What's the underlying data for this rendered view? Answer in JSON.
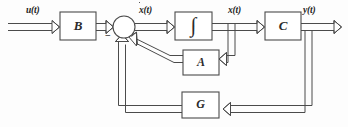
{
  "diagram": {
    "type": "control-system-block-diagram",
    "line_color": "#4b4b4b",
    "text_color": "#1f1f1f",
    "background": "#fdfdfd",
    "blocks": [
      {
        "id": "B",
        "label": "B",
        "name": "input-matrix-block",
        "x": 60,
        "y": 12,
        "w": 36,
        "h": 28
      },
      {
        "id": "INT",
        "label": "∫",
        "name": "integrator-block",
        "x": 175,
        "y": 12,
        "w": 37,
        "h": 28
      },
      {
        "id": "C",
        "label": "C",
        "name": "output-matrix-block",
        "x": 265,
        "y": 12,
        "w": 36,
        "h": 28
      },
      {
        "id": "A",
        "label": "A",
        "name": "state-matrix-block",
        "x": 183,
        "y": 50,
        "w": 36,
        "h": 25
      },
      {
        "id": "G",
        "label": "G",
        "name": "feedback-gain-block",
        "x": 182,
        "y": 92,
        "w": 37,
        "h": 26
      }
    ],
    "summing_junction": {
      "name": "summing-junction",
      "cx": 124,
      "cy": 27,
      "r": 11,
      "sign": "−"
    },
    "signals": [
      {
        "id": "u",
        "label": "u(t)",
        "name": "signal-label-u",
        "x": 26,
        "y": 6
      },
      {
        "id": "xdot",
        "label": "x(t)",
        "base": "x",
        "suffix": "(t)",
        "dotted": true,
        "name": "signal-label-xdot",
        "x": 139,
        "y": 6
      },
      {
        "id": "x",
        "label": "x(t)",
        "name": "signal-label-x",
        "x": 228,
        "y": 6
      },
      {
        "id": "y",
        "label": "y(t)",
        "name": "signal-label-y",
        "x": 305,
        "y": 6
      }
    ],
    "connections": [
      "u(t) -> B",
      "B -> summing-junction (+)",
      "summing-junction -> integrator [xdot(t)]",
      "integrator -> C [x(t)]",
      "C -> output [y(t)]",
      "x(t) -> A",
      "A -> summing-junction (-)",
      "y(t) -> G",
      "G -> summing-junction (-)"
    ]
  }
}
